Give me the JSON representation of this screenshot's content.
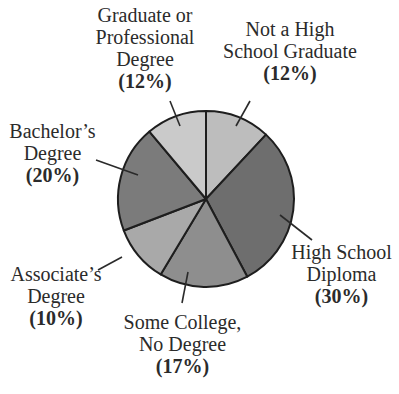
{
  "chart_data": {
    "type": "pie",
    "title": "",
    "start_angle_deg": 0,
    "direction": "clockwise",
    "slices": [
      {
        "label": "Not a High School Graduate",
        "lines": [
          "Not a High",
          "School Graduate"
        ],
        "value": 12,
        "pct_text": "(12%)",
        "color": "#bdbdbd",
        "end_deg": 43
      },
      {
        "label": "High School Diploma",
        "lines": [
          "High School",
          "Diploma"
        ],
        "value": 30,
        "pct_text": "(30%)",
        "color": "#6e6e6e",
        "end_deg": 152
      },
      {
        "label": "Some College, No Degree",
        "lines": [
          "Some College,",
          "No Degree"
        ],
        "value": 17,
        "pct_text": "(17%)",
        "color": "#8e8e8e",
        "end_deg": 211
      },
      {
        "label": "Associate's Degree",
        "lines": [
          "Associate’s",
          "Degree"
        ],
        "value": 10,
        "pct_text": "(10%)",
        "color": "#a9a9a9",
        "end_deg": 249
      },
      {
        "label": "Bachelor's Degree",
        "lines": [
          "Bachelor’s",
          "Degree"
        ],
        "value": 20,
        "pct_text": "(20%)",
        "color": "#7b7b7b",
        "end_deg": 320
      },
      {
        "label": "Graduate or Professional Degree",
        "lines": [
          "Graduate or",
          "Professional",
          "Degree"
        ],
        "value": 12,
        "pct_text": "(12%)",
        "color": "#cacaca",
        "end_deg": 360
      }
    ],
    "legend": "none; slice labels placed around pie with leader lines"
  },
  "labels": {
    "nhsg": {
      "l1": "Not a High",
      "l2": "School Graduate",
      "pct": "(12%)"
    },
    "hsd": {
      "l1": "High School",
      "l2": "Diploma",
      "pct": "(30%)"
    },
    "scnd": {
      "l1": "Some College,",
      "l2": "No Degree",
      "pct": "(17%)"
    },
    "assoc": {
      "l1": "Associate’s",
      "l2": "Degree",
      "pct": "(10%)"
    },
    "bach": {
      "l1": "Bachelor’s",
      "l2": "Degree",
      "pct": "(20%)"
    },
    "grad": {
      "l1": "Graduate or",
      "l2": "Professional",
      "l3": "Degree",
      "pct": "(12%)"
    }
  }
}
